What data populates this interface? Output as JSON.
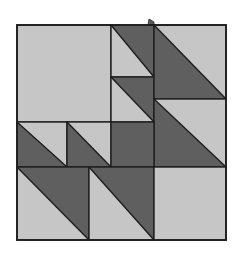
{
  "colors": {
    "light": "#c6c6c6",
    "dark": "#5f5f5f",
    "line": "#1e1e1e",
    "background": "#ffffff"
  },
  "quilt": {
    "name": "quilt-block",
    "outer": {
      "x": 17,
      "y": 25,
      "w": 209,
      "h": 215
    },
    "notch": {
      "points": "148,25 149,19 154,22 154,25"
    },
    "pieces": [
      {
        "name": "large-light-square",
        "type": "square",
        "x": 17,
        "y": 25,
        "w": 94,
        "h": 97,
        "fill": "light"
      },
      {
        "name": "hst-top-center-1",
        "type": "hst",
        "x": 111,
        "y": 25,
        "w": 43,
        "h": 52,
        "dark": "upper-right"
      },
      {
        "name": "hst-top-center-2",
        "type": "hst",
        "x": 111,
        "y": 77,
        "w": 43,
        "h": 45,
        "dark": "upper-right"
      },
      {
        "name": "hst-right-1",
        "type": "hst",
        "x": 154,
        "y": 25,
        "w": 72,
        "h": 74,
        "dark": "lower-left"
      },
      {
        "name": "hst-right-2",
        "type": "hst",
        "x": 154,
        "y": 99,
        "w": 72,
        "h": 68,
        "dark": "lower-left"
      },
      {
        "name": "hst-mid-left-1",
        "type": "hst",
        "x": 17,
        "y": 122,
        "w": 50,
        "h": 45,
        "dark": "lower-left"
      },
      {
        "name": "hst-mid-left-2",
        "type": "hst",
        "x": 67,
        "y": 122,
        "w": 44,
        "h": 45,
        "dark": "lower-left"
      },
      {
        "name": "dark-center-square",
        "type": "square",
        "x": 111,
        "y": 122,
        "w": 43,
        "h": 45,
        "fill": "dark"
      },
      {
        "name": "hst-bottom-1",
        "type": "hst",
        "x": 17,
        "y": 167,
        "w": 72,
        "h": 73,
        "dark": "upper-right"
      },
      {
        "name": "hst-bottom-2",
        "type": "hst",
        "x": 89,
        "y": 167,
        "w": 65,
        "h": 73,
        "dark": "upper-right"
      },
      {
        "name": "light-bottom-right-square",
        "type": "square",
        "x": 154,
        "y": 167,
        "w": 72,
        "h": 73,
        "fill": "light"
      }
    ]
  }
}
